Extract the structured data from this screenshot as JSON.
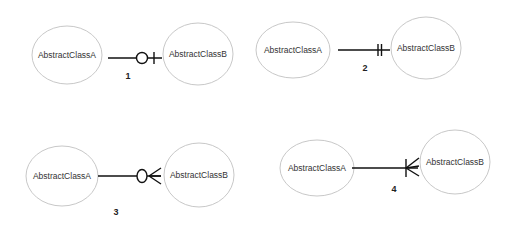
{
  "diagrams": [
    {
      "number": "1",
      "relationship": "zero-or-one",
      "entity_a": {
        "label": "AbstractClassA",
        "cx": 67,
        "cy": 55,
        "rx": 35,
        "ry": 29
      },
      "entity_b": {
        "label": "AbstractClassB",
        "cx": 198,
        "cy": 54,
        "rx": 35,
        "ry": 31
      },
      "line": {
        "x1": 108,
        "x2": 162,
        "y": 58
      },
      "label_pos": {
        "x": 128,
        "y": 79
      }
    },
    {
      "number": "2",
      "relationship": "exactly-one",
      "entity_a": {
        "label": "AbstractClassA",
        "cx": 293,
        "cy": 50,
        "rx": 37,
        "ry": 28
      },
      "entity_b": {
        "label": "AbstractClassB",
        "cx": 426,
        "cy": 48,
        "rx": 35,
        "ry": 31
      },
      "line": {
        "x1": 338,
        "x2": 390,
        "y": 50
      },
      "label_pos": {
        "x": 365,
        "y": 71
      }
    },
    {
      "number": "3",
      "relationship": "zero-or-many",
      "entity_a": {
        "label": "AbstractClassA",
        "cx": 62,
        "cy": 176,
        "rx": 36,
        "ry": 30
      },
      "entity_b": {
        "label": "AbstractClassB",
        "cx": 199,
        "cy": 175,
        "rx": 35,
        "ry": 32
      },
      "line": {
        "x1": 98,
        "x2": 161,
        "y": 176
      },
      "label_pos": {
        "x": 116,
        "y": 215
      }
    },
    {
      "number": "4",
      "relationship": "one-or-many",
      "entity_a": {
        "label": "AbstractClassA",
        "cx": 317,
        "cy": 168,
        "rx": 37,
        "ry": 28
      },
      "entity_b": {
        "label": "AbstractClassB",
        "cx": 455,
        "cy": 162,
        "rx": 35,
        "ry": 32
      },
      "line": {
        "x1": 352,
        "x2": 418,
        "y": 168
      },
      "label_pos": {
        "x": 394,
        "y": 192
      }
    }
  ],
  "colors": {
    "background": "#ffffff",
    "entity_stroke": "#c8c8c8",
    "line": "#111111",
    "text": "#333333"
  }
}
